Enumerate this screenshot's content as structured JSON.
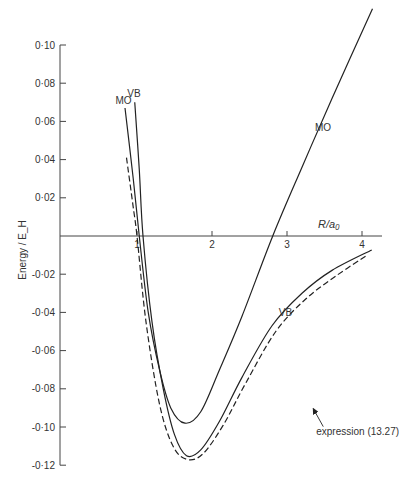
{
  "chart_data": {
    "type": "line",
    "title": "",
    "xlabel": "R/a₀",
    "ylabel": "Energy / E_H",
    "xlim": [
      0,
      4.3
    ],
    "ylim": [
      -0.12,
      0.1
    ],
    "x_ticks": [
      1,
      2,
      3,
      4
    ],
    "x_tick_labels": [
      "1",
      "2",
      "3",
      "4"
    ],
    "y_ticks": [
      0.1,
      0.08,
      0.06,
      0.04,
      0.02,
      -0.02,
      -0.04,
      -0.06,
      -0.08,
      -0.1,
      -0.12
    ],
    "y_tick_labels": [
      "0·10",
      "0·08",
      "0·06",
      "0·04",
      "0·02",
      "-0·02",
      "-0·04",
      "-0·06",
      "-0·08",
      "-0·10",
      "-0·12"
    ],
    "grid": false,
    "series": [
      {
        "name": "MO",
        "style": "solid",
        "labels": [
          "MO",
          "MO"
        ],
        "points": [
          [
            0.84,
            0.067
          ],
          [
            0.95,
            0.03
          ],
          [
            1.03,
            0.0
          ],
          [
            1.15,
            -0.04
          ],
          [
            1.3,
            -0.07
          ],
          [
            1.45,
            -0.09
          ],
          [
            1.64,
            -0.098
          ],
          [
            1.85,
            -0.092
          ],
          [
            2.1,
            -0.07
          ],
          [
            2.4,
            -0.042
          ],
          [
            2.81,
            0.0
          ],
          [
            3.2,
            0.036
          ],
          [
            3.6,
            0.072
          ],
          [
            4.14,
            0.119
          ]
        ]
      },
      {
        "name": "VB",
        "style": "solid",
        "labels": [
          "VB",
          "VB"
        ],
        "points": [
          [
            0.97,
            0.07
          ],
          [
            1.03,
            0.035
          ],
          [
            1.08,
            0.0
          ],
          [
            1.2,
            -0.045
          ],
          [
            1.35,
            -0.08
          ],
          [
            1.5,
            -0.104
          ],
          [
            1.66,
            -0.115
          ],
          [
            1.85,
            -0.112
          ],
          [
            2.1,
            -0.097
          ],
          [
            2.4,
            -0.074
          ],
          [
            2.8,
            -0.047
          ],
          [
            3.2,
            -0.03
          ],
          [
            3.6,
            -0.018
          ],
          [
            4.13,
            -0.0073
          ]
        ]
      },
      {
        "name": "expression (13.27)",
        "style": "dashed",
        "labels": [
          "expression (13.27)"
        ],
        "points": [
          [
            0.86,
            0.041
          ],
          [
            0.95,
            0.015
          ],
          [
            1.0,
            0.0
          ],
          [
            1.12,
            -0.045
          ],
          [
            1.3,
            -0.088
          ],
          [
            1.48,
            -0.11
          ],
          [
            1.67,
            -0.117
          ],
          [
            1.88,
            -0.114
          ],
          [
            2.15,
            -0.099
          ],
          [
            2.45,
            -0.077
          ],
          [
            2.85,
            -0.05
          ],
          [
            3.25,
            -0.033
          ],
          [
            3.65,
            -0.021
          ],
          [
            4.07,
            -0.01
          ]
        ]
      }
    ],
    "annotations": [
      {
        "text": "MO",
        "target": "MO",
        "at": [
          0.82,
          0.069
        ]
      },
      {
        "text": "VB",
        "target": "VB",
        "at": [
          0.96,
          0.073
        ]
      },
      {
        "text": "MO",
        "target": "MO",
        "at": [
          3.48,
          0.055
        ]
      },
      {
        "text": "VB",
        "target": "VB",
        "at": [
          2.98,
          -0.042
        ]
      },
      {
        "text": "expression (13.27)",
        "target": "expression (13.27)",
        "arrow": true,
        "at": [
          3.55,
          -0.104
        ]
      }
    ]
  }
}
